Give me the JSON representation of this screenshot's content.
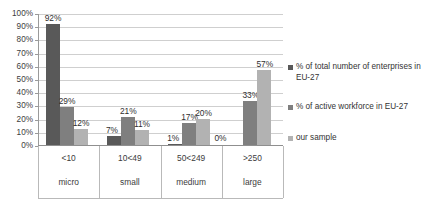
{
  "chart_data": {
    "type": "bar",
    "title": "",
    "subtitle": "",
    "xlabel": "",
    "ylabel": "",
    "ylim": [
      0,
      100
    ],
    "grid": true,
    "legend_position": "right",
    "orientation": "vertical",
    "grouping": "clustered",
    "value_suffix": "%",
    "categories": [
      "<10",
      "10<49",
      "50<249",
      ">250"
    ],
    "category_names": [
      "micro",
      "small",
      "medium",
      "large"
    ],
    "y_ticks": [
      "0%",
      "10%",
      "20%",
      "30%",
      "40%",
      "50%",
      "60%",
      "70%",
      "80%",
      "90%",
      "100%"
    ],
    "y_tick_values": [
      0,
      10,
      20,
      30,
      40,
      50,
      60,
      70,
      80,
      90,
      100
    ],
    "series": [
      {
        "name": "% of total number of enterprises in EU-27",
        "color": "#595959",
        "values": [
          92,
          7,
          1,
          0
        ],
        "labels": [
          "92%",
          "7%",
          "1%",
          "0%"
        ]
      },
      {
        "name": "% of active workforce in EU-27",
        "color": "#7f7f7f",
        "values": [
          29,
          21,
          17,
          33
        ],
        "labels": [
          "29%",
          "21%",
          "17%",
          "33%"
        ]
      },
      {
        "name": "our sample",
        "color": "#b2b2b2",
        "values": [
          12,
          11,
          20,
          57
        ],
        "labels": [
          "12%",
          "11%",
          "20%",
          "57%"
        ]
      }
    ]
  },
  "legend": {
    "entries": [
      {
        "label": "% of total number of enterprises in EU-27",
        "color": "#595959"
      },
      {
        "label": "% of active workforce in EU-27",
        "color": "#7f7f7f"
      },
      {
        "label": "our sample",
        "color": "#b2b2b2"
      }
    ]
  },
  "colors": {
    "series_1": "#595959",
    "series_2": "#7f7f7f",
    "series_3": "#b2b2b2",
    "grid": "#cfcfcf",
    "axis": "#9a9a9a",
    "text": "#333333",
    "background": "#ffffff"
  }
}
